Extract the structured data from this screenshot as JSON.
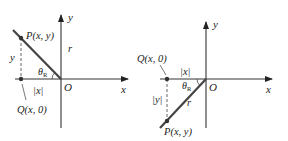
{
  "diagrams": [
    {
      "id": "second-quadrant",
      "axis_x_label": "x",
      "axis_y_label": "y",
      "origin_label": "O",
      "point_P_label": "P(x, y)",
      "point_Q_label": "Q(x, 0)",
      "radius_label": "r",
      "angle_label": "θ",
      "angle_subscript": "R",
      "vertical_leg_label": "y",
      "horizontal_leg_label": "|x|"
    },
    {
      "id": "third-quadrant",
      "axis_x_label": "x",
      "axis_y_label": "y",
      "origin_label": "O",
      "point_P_label": "P(x, y)",
      "point_Q_label": "Q(x, 0)",
      "radius_label": "r",
      "angle_label": "θ",
      "angle_subscript": "R",
      "vertical_leg_label": "|y|",
      "horizontal_leg_label": "|x|"
    }
  ]
}
